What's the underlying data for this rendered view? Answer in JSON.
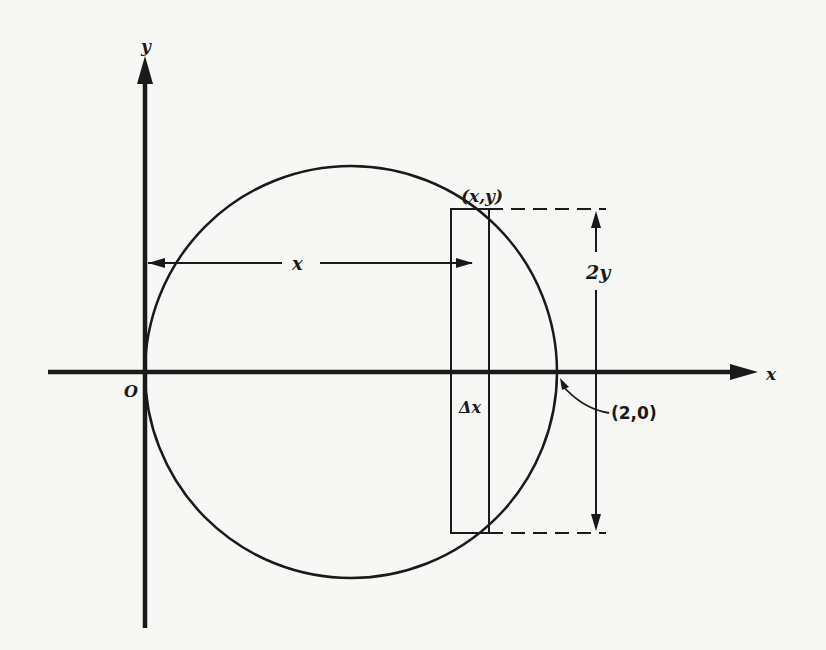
{
  "diagram": {
    "type": "geometry",
    "axes": {
      "x_label": "x",
      "y_label": "y",
      "origin_label": "O"
    },
    "circle": {
      "center": [
        1,
        0
      ],
      "radius": 1,
      "point_label": "(2,0)"
    },
    "strip": {
      "corner_label": "(x,y)",
      "width_label": "Δx",
      "height_label": "2y",
      "distance_label": "x"
    },
    "colors": {
      "ink": "#1a1a1a",
      "background": "#f7f7f5"
    }
  }
}
